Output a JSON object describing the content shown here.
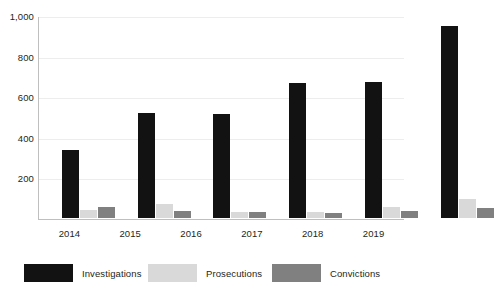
{
  "chart_data": {
    "type": "bar",
    "title": "",
    "subtitle": "",
    "xlabel": "",
    "ylabel": "",
    "categories": [
      "2014",
      "2015",
      "2016",
      "2017",
      "2018",
      "2019"
    ],
    "series": [
      {
        "name": "Investigations",
        "color": "#121212",
        "values": [
          335,
          515,
          512,
          663,
          668,
          948
        ]
      },
      {
        "name": "Prosecutions",
        "color": "#d9d9d9",
        "values": [
          40,
          70,
          30,
          28,
          55,
          95
        ]
      },
      {
        "name": "Convictions",
        "color": "#808080",
        "values": [
          55,
          35,
          28,
          25,
          35,
          50
        ]
      }
    ],
    "ylim": [
      0,
      1000
    ],
    "y_ticks": [
      0,
      200,
      400,
      600,
      800,
      1000
    ],
    "y_tick_labels": [
      "",
      "200",
      "400",
      "600",
      "800",
      "1,000"
    ],
    "grid": true,
    "grid_axis": "y",
    "legend_position": "bottom",
    "legend": [
      "Investigations",
      "Prosecutions",
      "Convictions"
    ]
  },
  "axes": {
    "y_labels": [
      {
        "text": "1,000",
        "value": 1000
      },
      {
        "text": "800",
        "value": 800
      },
      {
        "text": "600",
        "value": 600
      },
      {
        "text": "400",
        "value": 400
      },
      {
        "text": "200",
        "value": 200
      }
    ]
  }
}
